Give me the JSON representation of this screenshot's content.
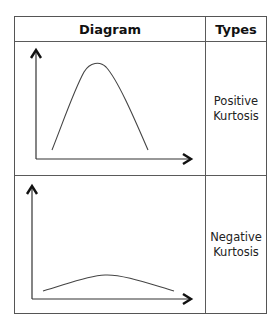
{
  "table": {
    "headers": {
      "diagram": "Diagram",
      "types": "Types"
    },
    "rows": [
      {
        "diagram": "peaked-curve",
        "type_line1": "Positive",
        "type_line2": "Kurtosis"
      },
      {
        "diagram": "flat-curve",
        "type_line1": "Negative",
        "type_line2": "Kurtosis"
      }
    ]
  },
  "colors": {
    "border": "#555555",
    "curve": "#444444",
    "axis": "#333333",
    "arrow": "#111111"
  }
}
